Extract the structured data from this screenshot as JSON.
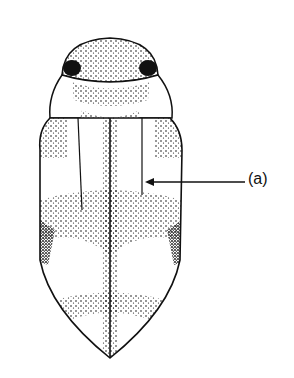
{
  "figure": {
    "labels": [
      {
        "id": "a",
        "text": "(a)"
      }
    ],
    "colors": {
      "ink": "#111111",
      "background": "#ffffff"
    }
  }
}
